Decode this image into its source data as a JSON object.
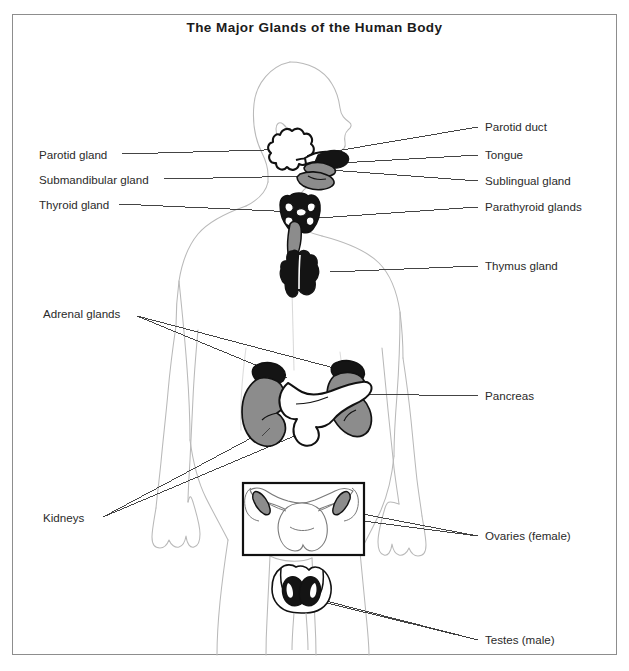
{
  "figure": {
    "title": "The Major Glands of the Human Body",
    "frame_color": "#8d8d8d",
    "background": "#ffffff"
  },
  "palette": {
    "body_outline": "#b9b9b9",
    "organ_outline": "#111111",
    "organ_dark": "#141414",
    "organ_gray": "#8c8c8c",
    "organ_light": "#ffffff",
    "leader_line": "#3a3a3a",
    "text": "#2a2a2a"
  },
  "labels_left": [
    {
      "id": "parotid-gland",
      "text": "Parotid gland",
      "x": 39,
      "y": 156
    },
    {
      "id": "submandibular-gland",
      "text": "Submandibular gland",
      "x": 39,
      "y": 181
    },
    {
      "id": "thyroid-gland",
      "text": "Thyroid gland",
      "x": 39,
      "y": 206
    },
    {
      "id": "adrenal-glands",
      "text": "Adrenal glands",
      "x": 43,
      "y": 313
    },
    {
      "id": "kidneys",
      "text": "Kidneys",
      "x": 43,
      "y": 519
    }
  ],
  "labels_right": [
    {
      "id": "parotid-duct",
      "text": "Parotid duct",
      "x": 485,
      "y": 129
    },
    {
      "id": "tongue",
      "text": "Tongue",
      "x": 485,
      "y": 157
    },
    {
      "id": "sublingual-gland",
      "text": "Sublingual gland",
      "x": 485,
      "y": 183
    },
    {
      "id": "parathyroid-glands",
      "text": "Parathyroid glands",
      "x": 485,
      "y": 209
    },
    {
      "id": "thymus-gland",
      "text": "Thymus gland",
      "x": 485,
      "y": 268
    },
    {
      "id": "pancreas",
      "text": "Pancreas",
      "x": 485,
      "y": 398
    },
    {
      "id": "ovaries-female",
      "text": "Ovaries (female)",
      "x": 485,
      "y": 538
    },
    {
      "id": "testes-male",
      "text": "Testes (male)",
      "x": 485,
      "y": 642
    }
  ],
  "structures": [
    {
      "id": "parotid-gland",
      "name": "Parotid gland",
      "fill": "white",
      "region": "head"
    },
    {
      "id": "parotid-duct",
      "name": "Parotid duct",
      "fill": "white",
      "region": "head"
    },
    {
      "id": "tongue",
      "name": "Tongue",
      "fill": "dark",
      "region": "head"
    },
    {
      "id": "sublingual-gland",
      "name": "Sublingual gland",
      "fill": "gray",
      "region": "head"
    },
    {
      "id": "submandibular-gland",
      "name": "Submandibular gland",
      "fill": "gray",
      "region": "head"
    },
    {
      "id": "thyroid-gland",
      "name": "Thyroid gland",
      "fill": "dark",
      "region": "neck"
    },
    {
      "id": "parathyroid-glands",
      "name": "Parathyroid glands",
      "fill": "white",
      "region": "neck"
    },
    {
      "id": "trachea",
      "name": "Trachea",
      "fill": "gray",
      "region": "neck"
    },
    {
      "id": "thymus-gland",
      "name": "Thymus gland",
      "fill": "dark",
      "region": "chest"
    },
    {
      "id": "adrenal-left",
      "name": "Adrenal gland left",
      "fill": "dark",
      "region": "abdomen"
    },
    {
      "id": "adrenal-right",
      "name": "Adrenal gland right",
      "fill": "dark",
      "region": "abdomen"
    },
    {
      "id": "kidney-left",
      "name": "Kidney left",
      "fill": "gray",
      "region": "abdomen"
    },
    {
      "id": "kidney-right",
      "name": "Kidney right",
      "fill": "gray",
      "region": "abdomen"
    },
    {
      "id": "pancreas",
      "name": "Pancreas",
      "fill": "white",
      "region": "abdomen"
    },
    {
      "id": "ovary-left",
      "name": "Ovary left",
      "fill": "gray",
      "region": "pelvis-inset"
    },
    {
      "id": "ovary-right",
      "name": "Ovary right",
      "fill": "gray",
      "region": "pelvis-inset"
    },
    {
      "id": "uterus",
      "name": "Uterus",
      "fill": "white",
      "region": "pelvis-inset"
    },
    {
      "id": "testis-left",
      "name": "Testis left",
      "fill": "dark",
      "region": "pelvis"
    },
    {
      "id": "testis-right",
      "name": "Testis right",
      "fill": "dark",
      "region": "pelvis"
    }
  ]
}
